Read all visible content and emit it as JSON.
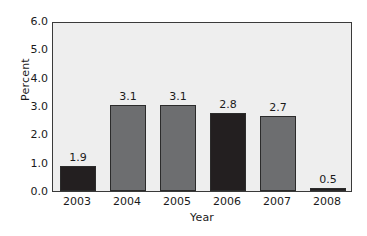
{
  "chart_data": {
    "type": "bar",
    "title": "",
    "subtitle": "",
    "xlabel": "Year",
    "ylabel": "Percent",
    "categories": [
      "2003",
      "2004",
      "2005",
      "2006",
      "2007",
      "2008"
    ],
    "values": [
      1.9,
      3.1,
      3.1,
      2.8,
      2.7,
      0.5
    ],
    "data_labels": [
      "1.9",
      "3.1",
      "3.1",
      "2.8",
      "2.7",
      "0.5"
    ],
    "drawn_values": [
      0.9,
      3.05,
      3.05,
      2.75,
      2.65,
      0.1
    ],
    "bar_colors": [
      "#231f20",
      "#6d6e70",
      "#6d6e70",
      "#231f20",
      "#6d6e70",
      "#231f20"
    ],
    "ylim": [
      0.0,
      6.0
    ],
    "ytick_step": 1.0,
    "ytick_labels": [
      "6.0",
      "5.0",
      "4.0",
      "3.0",
      "2.0",
      "1.0",
      "0.0"
    ],
    "ytick_values": [
      6.0,
      5.0,
      4.0,
      3.0,
      2.0,
      1.0,
      0.0
    ],
    "grid": false,
    "legend": null,
    "legend_position": "none",
    "plot_background": "#eeeeee",
    "plot_border_color": "#3a3a3a",
    "figure_background": "#ffffff",
    "annotations": []
  }
}
